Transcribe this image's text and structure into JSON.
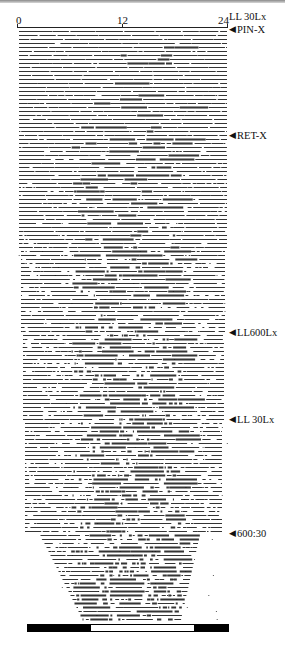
{
  "figure": {
    "type": "actogram",
    "x_axis": {
      "ticks": [
        {
          "label": "0",
          "hour": 0
        },
        {
          "label": "12",
          "hour": 12
        },
        {
          "label": "24",
          "hour": 24
        }
      ],
      "range": [
        0,
        24
      ],
      "unit": "hours"
    },
    "condition_labels": [
      {
        "text": "LL 30Lx",
        "arrow": false,
        "y": 11
      },
      {
        "text": "PIN-X",
        "arrow": true,
        "y": 24
      },
      {
        "text": "RET-X",
        "arrow": true,
        "y": 130
      },
      {
        "text": "LL600Lx",
        "arrow": true,
        "y": 327
      },
      {
        "text": "LL 30Lx",
        "arrow": true,
        "y": 414
      },
      {
        "text": "600:30",
        "arrow": true,
        "y": 528
      }
    ],
    "light_bar": [
      {
        "state": "dark",
        "color": "#000000",
        "fraction": 0.315
      },
      {
        "state": "light",
        "color": "#ffffff",
        "fraction": 0.515
      },
      {
        "state": "dark",
        "color": "#000000",
        "fraction": 0.17
      }
    ],
    "arrow_glyph": "◀"
  },
  "chart_data": {
    "type": "actogram",
    "title": "",
    "xlabel": "Time of day (h)",
    "ylabel": "Days",
    "x_ticks": [
      "0",
      "12",
      "24"
    ],
    "xlim": [
      0,
      24
    ],
    "annotations": [
      "LL 30Lx",
      "PIN-X",
      "RET-X",
      "LL600Lx",
      "LL 30Lx",
      "600:30"
    ],
    "sections": [
      {
        "condition": "LL 30Lx / PIN-X",
        "row_start_y": 30,
        "row_end_y": 136,
        "activity": "continuous, low-amplitude"
      },
      {
        "condition": "RET-X",
        "row_start_y": 136,
        "row_end_y": 333,
        "activity": "increasingly fragmented"
      },
      {
        "condition": "LL600Lx",
        "row_start_y": 333,
        "row_end_y": 420,
        "activity": "fragmented"
      },
      {
        "condition": "LL 30Lx",
        "row_start_y": 420,
        "row_end_y": 534,
        "activity": "fragmented, dense mid-day"
      },
      {
        "condition": "600:30 LD",
        "row_start_y": 534,
        "row_end_y": 622,
        "activity": "consolidated ~7–16 h"
      }
    ],
    "row_spacing_px": 4
  }
}
